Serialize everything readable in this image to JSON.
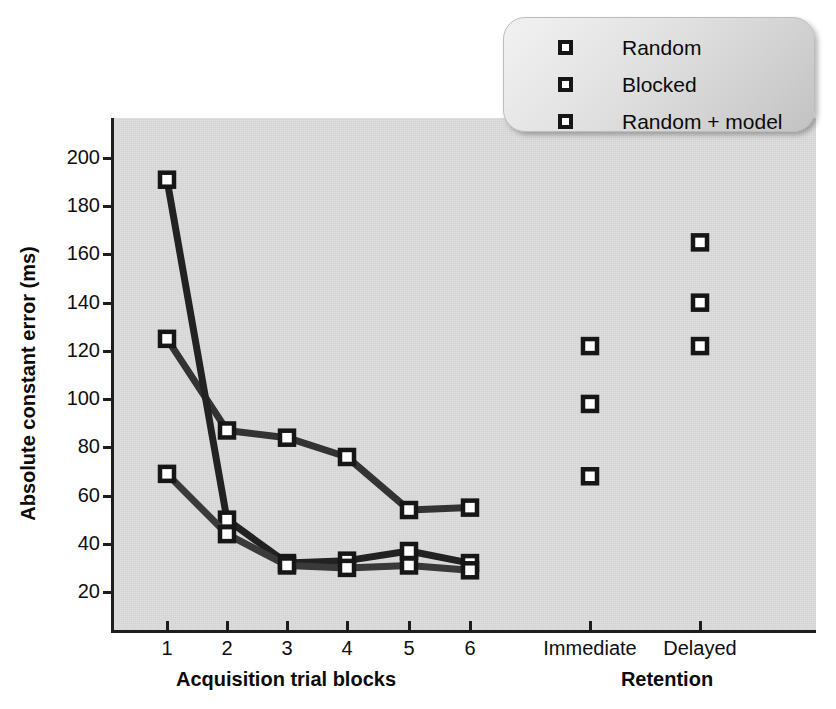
{
  "chart_data": {
    "type": "line",
    "title": "",
    "xlabel": "",
    "ylabel": "Absolute constant error (ms)",
    "ylim": [
      10,
      210
    ],
    "yticks": [
      20,
      40,
      60,
      80,
      100,
      120,
      140,
      160,
      180,
      200
    ],
    "grid": false,
    "legend_position": "top-right",
    "x_groups": [
      {
        "name": "Acquisition trial blocks",
        "categories": [
          "1",
          "2",
          "3",
          "4",
          "5",
          "6"
        ]
      },
      {
        "name": "Retention",
        "categories": [
          "Immediate",
          "Delayed"
        ]
      }
    ],
    "categories": [
      "1",
      "2",
      "3",
      "4",
      "5",
      "6",
      "Immediate",
      "Delayed"
    ],
    "series": [
      {
        "name": "Random",
        "color": "#333333",
        "connected_range": [
          0,
          5
        ],
        "values": [
          125,
          87,
          84,
          76,
          54,
          55,
          122,
          165
        ]
      },
      {
        "name": "Blocked",
        "color": "#222222",
        "connected_range": [
          0,
          5
        ],
        "values": [
          191,
          50,
          32,
          33,
          37,
          32,
          98,
          140
        ]
      },
      {
        "name": "Random + model",
        "color": "#3a3a3a",
        "connected_range": [
          0,
          5
        ],
        "values": [
          69,
          44,
          31,
          30,
          31,
          29,
          68,
          122
        ]
      }
    ]
  },
  "legend": {
    "items": [
      {
        "label": "Random"
      },
      {
        "label": "Blocked"
      },
      {
        "label": "Random + model"
      }
    ]
  },
  "colors": {
    "line": "#2b2b2b",
    "marker_fill": "#ffffff",
    "marker_edge": "#161616",
    "panel_bg": "#dedede",
    "axis": "#1d1d1d",
    "text": "#0b0b0b"
  }
}
